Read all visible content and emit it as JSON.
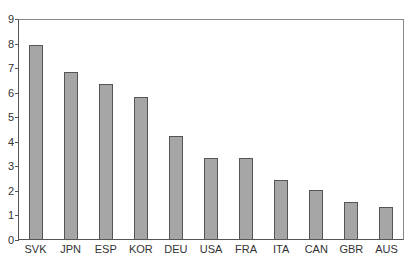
{
  "chart_data": {
    "type": "bar",
    "title": "",
    "xlabel": "",
    "ylabel": "",
    "categories": [
      "SVK",
      "JPN",
      "ESP",
      "KOR",
      "DEU",
      "USA",
      "FRA",
      "ITA",
      "CAN",
      "GBR",
      "AUS"
    ],
    "values": [
      7.9,
      6.8,
      6.3,
      5.8,
      4.2,
      3.3,
      3.3,
      2.4,
      2.0,
      1.5,
      1.3
    ],
    "ylim": [
      0,
      9
    ],
    "yticks": [
      "0",
      "1",
      "2",
      "3",
      "4",
      "5",
      "6",
      "7",
      "8",
      "9"
    ],
    "grid": false,
    "legend": null,
    "bar_color": "#a6a6a6"
  }
}
